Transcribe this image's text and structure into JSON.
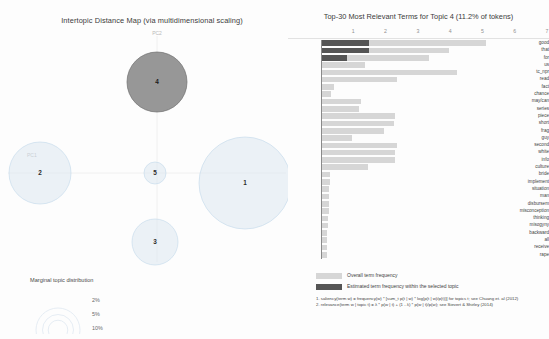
{
  "left": {
    "title": "Intertopic Distance Map (via multidimensional scaling)",
    "axis_x_label": "PC1",
    "axis_y_label": "PC2",
    "marginal_legend_title": "Marginal topic distribution",
    "marginal_sizes": [
      "2%",
      "5%",
      "10%"
    ],
    "topics": [
      {
        "id": "1",
        "cx": 245,
        "cy": 183,
        "r": 46,
        "selected": false
      },
      {
        "id": "2",
        "cx": 40,
        "cy": 173,
        "r": 31,
        "selected": false
      },
      {
        "id": "3",
        "cx": 155,
        "cy": 242,
        "r": 23,
        "selected": false
      },
      {
        "id": "4",
        "cx": 157,
        "cy": 82,
        "r": 30,
        "selected": true
      },
      {
        "id": "5",
        "cx": 155,
        "cy": 173,
        "r": 11,
        "selected": false
      }
    ]
  },
  "right": {
    "title": "Top-30 Most Relevant Terms for Topic 4 (11.2% of tokens)",
    "selected_topic": "4",
    "topic_token_pct": "11.2%",
    "axis_ticks": [
      "1",
      "2",
      "3",
      "4",
      "5",
      "6",
      "7"
    ],
    "axis_max": 7,
    "legend": {
      "overall_label": "Overall term frequency",
      "within_label": "Estimated term frequency within the selected topic",
      "formula1": "1. saliency(term w) = frequency(w) * [sum_t p(t | w) * log(p(t | w)/p(t))] for topics t; see Chuang et. al (2012)",
      "formula2": "2. relevance(term w | topic t) = λ * p(w | t) + (1 - λ) * p(w | t)/p(w); see Sievert & Shirley (2014)"
    },
    "colors": {
      "overall_bar": "#d6d6d6",
      "within_bar": "#555555",
      "selected_bubble": "#8e8e8e",
      "unselected_bubble": "#d9e6f0"
    },
    "terms": [
      {
        "term": "good",
        "overall": 5.1,
        "within": 1.5
      },
      {
        "term": "that",
        "overall": 3.95,
        "within": 1.5
      },
      {
        "term": "for",
        "overall": 3.35,
        "within": 0.8
      },
      {
        "term": "us",
        "overall": 1.35,
        "within": 0.0
      },
      {
        "term": "tc_npr",
        "overall": 4.2,
        "within": 0.0
      },
      {
        "term": "read",
        "overall": 2.35,
        "within": 0.0
      },
      {
        "term": "fact",
        "overall": 0.4,
        "within": 0.0
      },
      {
        "term": "chance",
        "overall": 0.32,
        "within": 0.0
      },
      {
        "term": "may/can",
        "overall": 1.25,
        "within": 0.0
      },
      {
        "term": "series",
        "overall": 1.18,
        "within": 0.0
      },
      {
        "term": "piece",
        "overall": 2.3,
        "within": 0.0
      },
      {
        "term": "short",
        "overall": 2.25,
        "within": 0.0
      },
      {
        "term": "frag",
        "overall": 1.95,
        "within": 0.0
      },
      {
        "term": "guy",
        "overall": 0.95,
        "within": 0.0
      },
      {
        "term": "second",
        "overall": 2.35,
        "within": 0.0
      },
      {
        "term": "white",
        "overall": 2.3,
        "within": 0.0
      },
      {
        "term": "info",
        "overall": 2.3,
        "within": 0.0
      },
      {
        "term": "culture",
        "overall": 1.45,
        "within": 0.0
      },
      {
        "term": "bride",
        "overall": 0.28,
        "within": 0.0
      },
      {
        "term": "implement",
        "overall": 0.28,
        "within": 0.0
      },
      {
        "term": "situation",
        "overall": 0.26,
        "within": 0.0
      },
      {
        "term": "man",
        "overall": 0.26,
        "within": 0.0
      },
      {
        "term": "disbursem",
        "overall": 0.24,
        "within": 0.0
      },
      {
        "term": "misconception",
        "overall": 0.24,
        "within": 0.0
      },
      {
        "term": "thinking",
        "overall": 0.22,
        "within": 0.0
      },
      {
        "term": "misogyny",
        "overall": 0.22,
        "within": 0.0
      },
      {
        "term": "backward",
        "overall": 0.2,
        "within": 0.0
      },
      {
        "term": "all",
        "overall": 0.2,
        "within": 0.0
      },
      {
        "term": "receive",
        "overall": 0.18,
        "within": 0.0
      },
      {
        "term": "rape",
        "overall": 0.18,
        "within": 0.0
      }
    ]
  },
  "chart_data": {
    "type": "bar",
    "title": "Top-30 Most Relevant Terms for Topic 4 (11.2% of tokens)",
    "orientation": "horizontal",
    "xlabel": "",
    "ylabel": "",
    "xlim": [
      0,
      7
    ],
    "grid": false,
    "legend_position": "bottom-left",
    "categories": [
      "good",
      "that",
      "for",
      "us",
      "tc_npr",
      "read",
      "fact",
      "chance",
      "may/can",
      "series",
      "piece",
      "short",
      "frag",
      "guy",
      "second",
      "white",
      "info",
      "culture",
      "bride",
      "implement",
      "situation",
      "man",
      "disbursem",
      "misconception",
      "thinking",
      "misogyny",
      "backward",
      "all",
      "receive",
      "rape"
    ],
    "series": [
      {
        "name": "Overall term frequency",
        "values": [
          5.1,
          3.95,
          3.35,
          1.35,
          4.2,
          2.35,
          0.4,
          0.32,
          1.25,
          1.18,
          2.3,
          2.25,
          1.95,
          0.95,
          2.35,
          2.3,
          2.3,
          1.45,
          0.28,
          0.28,
          0.26,
          0.26,
          0.24,
          0.24,
          0.22,
          0.22,
          0.2,
          0.2,
          0.18,
          0.18
        ]
      },
      {
        "name": "Estimated term frequency within the selected topic",
        "values": [
          1.5,
          1.5,
          0.8,
          0.0,
          0.0,
          0.0,
          0.0,
          0.0,
          0.0,
          0.0,
          0.0,
          0.0,
          0.0,
          0.0,
          0.0,
          0.0,
          0.0,
          0.0,
          0.0,
          0.0,
          0.0,
          0.0,
          0.0,
          0.0,
          0.0,
          0.0,
          0.0,
          0.0,
          0.0,
          0.0
        ]
      }
    ]
  }
}
